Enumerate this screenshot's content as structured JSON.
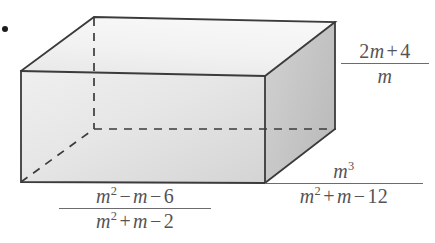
{
  "figure": {
    "kind": "rectangular-prism-diagram",
    "bullet": "•",
    "solid": {
      "name": "rectangular prism",
      "faces": {
        "top_fill_light": "#f4f4f4",
        "top_fill_dark": "#e6e6e6",
        "front_fill_light": "#ededed",
        "front_fill_dark": "#d6d6d6",
        "right_fill_light": "#cfcfcf",
        "right_fill_dark": "#bdbdbd"
      },
      "edge_color": "#3b3b3b",
      "hidden_edge_color": "#3b3b3b",
      "vertices": {
        "front_top_left": [
          21,
          71
        ],
        "front_top_right": [
          265,
          76
        ],
        "front_bottom_left": [
          21,
          182
        ],
        "front_bottom_right": [
          265,
          183
        ],
        "back_top_left": [
          94,
          17
        ],
        "back_top_right": [
          335,
          22
        ],
        "back_bottom_left": [
          94,
          129
        ],
        "back_bottom_right": [
          335,
          129
        ]
      }
    },
    "labels": {
      "height": {
        "role": "height",
        "text": "(2m + 4) / m",
        "numerator": {
          "coef": "2",
          "var": "m",
          "op": "+",
          "const": "4"
        },
        "denominator": {
          "var": "m"
        }
      },
      "depth": {
        "role": "depth",
        "text": "m^3 / (m^2 + m - 12)",
        "numerator": {
          "var": "m",
          "exp": "3"
        },
        "denominator": {
          "t1_var": "m",
          "t1_exp": "2",
          "op1": "+",
          "t2_var": "m",
          "op2": "−",
          "const": "12"
        }
      },
      "width": {
        "role": "width",
        "text": "(m^2 - m - 6) / (m^2 + m - 2)",
        "numerator": {
          "t1_var": "m",
          "t1_exp": "2",
          "op1": "−",
          "t2_var": "m",
          "op2": "−",
          "const": "6"
        },
        "denominator": {
          "t1_var": "m",
          "t1_exp": "2",
          "op1": "+",
          "t2_var": "m",
          "op2": "−",
          "const": "2"
        }
      }
    }
  }
}
